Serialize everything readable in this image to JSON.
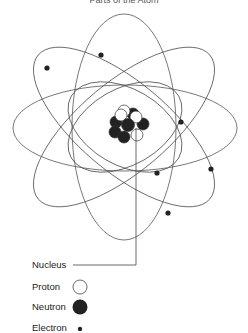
{
  "title": "Parts of the Atom",
  "legend": {
    "nucleus": "Nucleus",
    "proton": "Proton",
    "neutron": "Neutron",
    "electron": "Electron"
  },
  "colors": {
    "line": "#555555",
    "neutron": "#222222",
    "proton": "#ffffff",
    "electron": "#222222"
  }
}
